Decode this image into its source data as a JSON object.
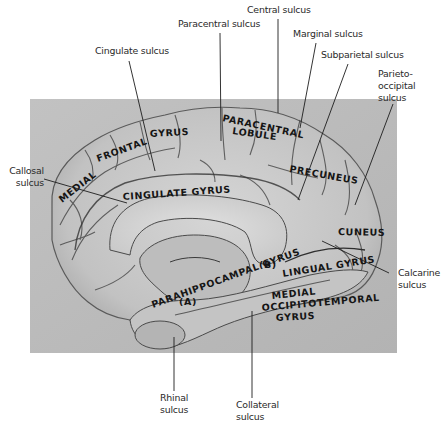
{
  "figure": {
    "type": "labeled anatomical photograph",
    "colors": {
      "page_background": "#ffffff",
      "photo_background": "#b9b9b9",
      "brain_surface": "#c9c9c9",
      "sulcus_shadow": "#3c3c3c",
      "label_text": "#151515",
      "callout_text": "#2a2a2a"
    }
  },
  "callouts": {
    "cingulate_sulcus": "Cingulate sulcus",
    "paracentral_sulcus": "Paracentral sulcus",
    "central_sulcus": "Central sulcus",
    "marginal_sulcus": "Marginal sulcus",
    "subparietal_sulcus": "Subparietal sulcus",
    "parieto_occipital_sulcus": [
      "Parieto-",
      "occipital",
      "sulcus"
    ],
    "callosal_sulcus": [
      "Callosal",
      "sulcus"
    ],
    "calcarine_sulcus": [
      "Calcarine",
      "sulcus"
    ],
    "rhinal_sulcus": [
      "Rhinal",
      "sulcus"
    ],
    "collateral_sulcus": [
      "Collateral",
      "sulcus"
    ]
  },
  "regions": {
    "medial_frontal_gyrus": "MEDIAL FRONTAL GYRUS",
    "medial": "MEDIAL",
    "frontal": "FRONTAL",
    "gyrus_frontal": "GYRUS",
    "paracentral": "PARACENTRAL",
    "lobule": "LOBULE",
    "cingulate_gyrus": "CINGULATE GYRUS",
    "precuneus": "PRECUNEUS",
    "cuneus": "CUNEUS",
    "lingual_gyrus": "LINGUAL GYRUS",
    "parahippocampal_gyrus": "PARAHIPPOCAMPAL GYRUS",
    "medial_occipitotemporal_1": "MEDIAL",
    "medial_occipitotemporal_2": "OCCIPITOTEMPORAL",
    "medial_occipitotemporal_3": "GYRUS",
    "marker_a": "(A)",
    "marker_b": "(B)"
  }
}
